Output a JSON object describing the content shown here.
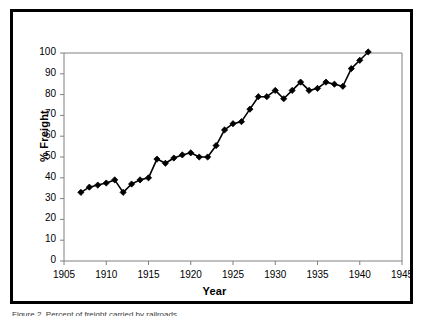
{
  "figure": {
    "border_color": "#000000",
    "background": "#ffffff",
    "caption_sliver": "Figure 2.  Percent of freight carried by railroads"
  },
  "chart_data": {
    "type": "line",
    "title": "",
    "xlabel": "Year",
    "ylabel": "% Freight",
    "xlim": [
      1905,
      1945
    ],
    "ylim": [
      0,
      100
    ],
    "xticks": [
      1905,
      1910,
      1915,
      1920,
      1925,
      1930,
      1935,
      1940,
      1945
    ],
    "yticks": [
      0,
      10,
      20,
      30,
      40,
      50,
      60,
      70,
      80,
      90,
      100
    ],
    "grid": false,
    "legend": "none",
    "marker": "diamond",
    "marker_color": "#000000",
    "line_color": "#000000",
    "line_width": 1.6,
    "axis_color": "#808080",
    "x": [
      1907,
      1908,
      1909,
      1910,
      1911,
      1912,
      1913,
      1914,
      1915,
      1916,
      1917,
      1918,
      1919,
      1920,
      1921,
      1922,
      1923,
      1924,
      1925,
      1926,
      1927,
      1928,
      1929,
      1930,
      1931,
      1932,
      1933,
      1934,
      1935,
      1936,
      1937,
      1938,
      1939,
      1940,
      1941
    ],
    "values": [
      33,
      35.5,
      36.5,
      37.5,
      39,
      33,
      37,
      39,
      40,
      49,
      47,
      49.5,
      51,
      52,
      50,
      50,
      55.5,
      63,
      66,
      67,
      73,
      79,
      79,
      82,
      78,
      82,
      86,
      82,
      83,
      86,
      85,
      84,
      92.5,
      96.5,
      100.5
    ],
    "series": [
      {
        "name": "% Freight",
        "values": [
          33,
          35.5,
          36.5,
          37.5,
          39,
          33,
          37,
          39,
          40,
          49,
          47,
          49.5,
          51,
          52,
          50,
          50,
          55.5,
          63,
          66,
          67,
          73,
          79,
          79,
          82,
          78,
          82,
          86,
          82,
          83,
          86,
          85,
          84,
          92.5,
          96.5,
          100.5
        ]
      }
    ]
  }
}
